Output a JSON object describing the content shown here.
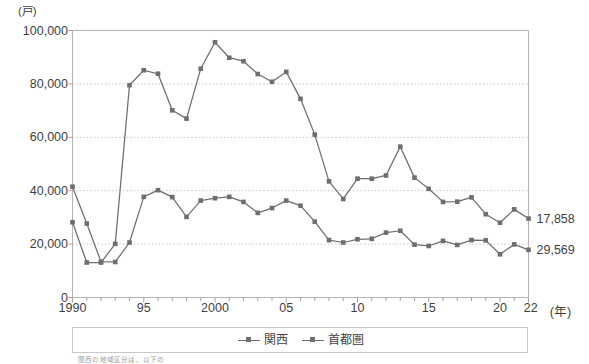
{
  "chart_data": {
    "type": "line",
    "title": "",
    "unit_label": "(戸)",
    "xlabel": "(年)",
    "ylabel": "",
    "grid": true,
    "legend_position": "bottom",
    "ylim": [
      0,
      100000
    ],
    "ytick_values": [
      0,
      20000,
      40000,
      60000,
      80000,
      100000
    ],
    "ytick_labels": [
      "0",
      "20,000",
      "40,000",
      "60,000",
      "80,000",
      "100,000"
    ],
    "xlim": [
      1990,
      2022
    ],
    "xtick_values": [
      1990,
      1995,
      2000,
      2005,
      2010,
      2015,
      2020,
      2022
    ],
    "xtick_labels": [
      "1990",
      "95",
      "2000",
      "05",
      "10",
      "15",
      "20",
      "22"
    ],
    "x": [
      1990,
      1991,
      1992,
      1993,
      1994,
      1995,
      1996,
      1997,
      1998,
      1999,
      2000,
      2001,
      2002,
      2003,
      2004,
      2005,
      2006,
      2007,
      2008,
      2009,
      2010,
      2011,
      2012,
      2013,
      2014,
      2015,
      2016,
      2017,
      2018,
      2019,
      2020,
      2021,
      2022
    ],
    "series": [
      {
        "name": "関西",
        "color": "#6e6e6e",
        "end_label": "29,569",
        "values": [
          41500,
          27700,
          13400,
          13300,
          20600,
          37700,
          40200,
          37600,
          30200,
          36300,
          37200,
          37700,
          35800,
          31700,
          33500,
          36300,
          34400,
          28400,
          21500,
          20600,
          21800,
          22000,
          24300,
          25000,
          19800,
          19300,
          21200,
          19700,
          21500,
          21400,
          16200,
          19900,
          17858
        ]
      },
      {
        "name": "首都圏",
        "color": "#6e6e6e",
        "end_label": "17,858",
        "values": [
          28200,
          13100,
          13100,
          20100,
          79500,
          85100,
          83800,
          70100,
          67000,
          85700,
          95600,
          89800,
          88500,
          83700,
          80800,
          84500,
          74400,
          61000,
          43500,
          36900,
          44500,
          44500,
          45700,
          56500,
          44900,
          40700,
          35800,
          35900,
          37500,
          31200,
          28000,
          33000,
          29569
        ]
      }
    ],
    "end_labels": [
      "29,569",
      "17,858"
    ]
  },
  "legend": {
    "items": [
      {
        "label": "関西",
        "marker": "square-dashed-line"
      },
      {
        "label": "首都圏",
        "marker": "square-dashed-line"
      }
    ]
  },
  "footer": {
    "source_note": "関西の地域区分は、以下の"
  }
}
